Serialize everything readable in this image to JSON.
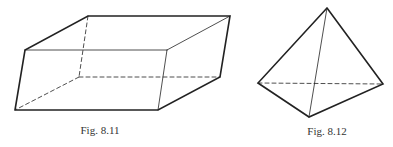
{
  "figures": [
    {
      "id": "fig-8-11",
      "caption": "Fig. 8.11",
      "shape": "parallelepiped",
      "vertices": {
        "front_top_left": [
          25,
          50
        ],
        "front_top_right": [
          167,
          50
        ],
        "front_bottom_left": [
          15,
          110
        ],
        "front_bottom_right": [
          158,
          110
        ],
        "back_top_left": [
          88,
          16
        ],
        "back_top_right": [
          230,
          16
        ],
        "back_bottom_left": [
          79,
          77
        ],
        "back_bottom_right": [
          220,
          77
        ]
      }
    },
    {
      "id": "fig-8-12",
      "caption": "Fig. 8.12",
      "shape": "tetrahedron",
      "vertices": {
        "apex": [
          327,
          8
        ],
        "left": [
          258,
          83
        ],
        "right": [
          383,
          84
        ],
        "front": [
          309,
          117
        ]
      }
    }
  ],
  "colors": {
    "stroke": "#222222",
    "caption": "#333333"
  }
}
